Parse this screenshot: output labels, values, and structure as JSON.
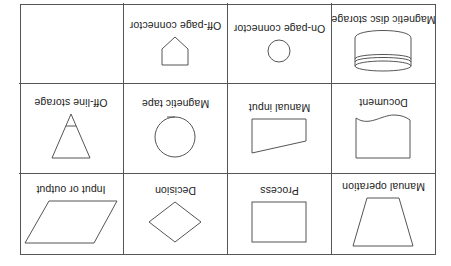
{
  "orientation": "rotated 180 degrees",
  "symbols": [
    {
      "label": "Manual operation",
      "icon": "trapezoid-icon"
    },
    {
      "label": "Process",
      "icon": "rectangle-icon"
    },
    {
      "label": "Decision",
      "icon": "diamond-icon"
    },
    {
      "label": "Input or output",
      "icon": "parallelogram-icon"
    },
    {
      "label": "Document",
      "icon": "document-icon"
    },
    {
      "label": "Manual input",
      "icon": "manual-input-icon"
    },
    {
      "label": "Magnetic tape",
      "icon": "circle-tape-icon"
    },
    {
      "label": "Off-line storage",
      "icon": "triangle-storage-icon"
    },
    {
      "label": "Magnetic disc storage",
      "icon": "cylinder-icon"
    },
    {
      "label": "On-page connector",
      "icon": "small-circle-icon"
    },
    {
      "label": "Off-page connector",
      "icon": "pentagon-icon"
    },
    {
      "label": "",
      "icon": "none"
    }
  ],
  "colors": {
    "line": "#555555",
    "text": "#222222",
    "background": "#ffffff"
  }
}
